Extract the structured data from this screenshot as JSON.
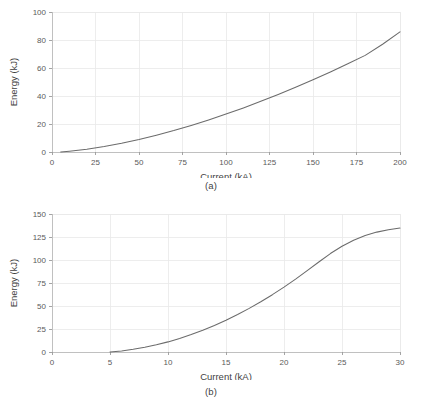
{
  "figure": {
    "background": "#ffffff",
    "curve_color": "#6b6b6b",
    "grid_color": "#e9e9e9",
    "axis_color": "#b9b9b9"
  },
  "panels": [
    {
      "id": "a",
      "caption": "(a)",
      "xlabel": "Current (kA)",
      "ylabel": "Energy (kJ)"
    },
    {
      "id": "b",
      "caption": "(b)",
      "xlabel": "Current (kA)",
      "ylabel": "Energy (kJ)"
    }
  ],
  "chart_data": [
    {
      "type": "line",
      "title": "",
      "panel_label": "(a)",
      "xlabel": "Current (kA)",
      "ylabel": "Energy (kJ)",
      "xlim": [
        0,
        200
      ],
      "ylim": [
        0,
        100
      ],
      "xticks": [
        0,
        25,
        50,
        75,
        100,
        125,
        150,
        175,
        200
      ],
      "xticklabels": [
        "0",
        "25",
        "50",
        "75",
        "100",
        "125",
        "150",
        "175",
        "200"
      ],
      "yticks": [
        0,
        20,
        40,
        60,
        80,
        100
      ],
      "yticklabels": [
        "0",
        "20",
        "40",
        "60",
        "80",
        "100"
      ],
      "grid": true,
      "legend": null,
      "series": [
        {
          "name": "Energy vs Current",
          "x": [
            5,
            10,
            20,
            30,
            40,
            50,
            60,
            70,
            80,
            90,
            100,
            110,
            120,
            130,
            140,
            150,
            160,
            170,
            180,
            190,
            200
          ],
          "y": [
            0.0,
            0.6,
            2.0,
            3.9,
            6.2,
            8.9,
            12.0,
            15.3,
            19.0,
            22.9,
            27.1,
            31.5,
            36.2,
            41.1,
            46.3,
            51.6,
            57.2,
            63.0,
            69.0,
            77.0,
            85.8
          ]
        }
      ]
    },
    {
      "type": "line",
      "title": "",
      "panel_label": "(b)",
      "xlabel": "Current (kA)",
      "ylabel": "Energy (kJ)",
      "xlim": [
        0,
        30
      ],
      "ylim": [
        0,
        150
      ],
      "xticks": [
        0,
        5,
        10,
        15,
        20,
        25,
        30
      ],
      "xticklabels": [
        "0",
        "5",
        "10",
        "15",
        "20",
        "25",
        "30"
      ],
      "yticks": [
        0,
        25,
        50,
        75,
        100,
        125,
        150
      ],
      "yticklabels": [
        "0",
        "25",
        "50",
        "75",
        "100",
        "125",
        "150"
      ],
      "grid": true,
      "legend": null,
      "series": [
        {
          "name": "Energy vs Current",
          "x": [
            5,
            6,
            7,
            8,
            9,
            10,
            11,
            12,
            13,
            14,
            15,
            16,
            17,
            18,
            19,
            20,
            21,
            22,
            23,
            24,
            25,
            26,
            27,
            28,
            29,
            30
          ],
          "y": [
            0.0,
            1.2,
            2.9,
            5.1,
            7.8,
            11.0,
            14.7,
            18.9,
            23.6,
            28.8,
            34.5,
            40.7,
            47.4,
            54.6,
            62.3,
            70.5,
            79.2,
            88.4,
            97.8,
            107.0,
            115.0,
            121.5,
            126.7,
            130.3,
            132.8,
            134.8
          ]
        }
      ]
    }
  ]
}
